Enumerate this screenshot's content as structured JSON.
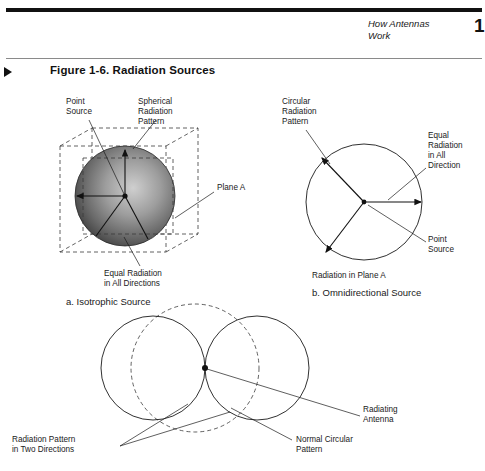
{
  "header": {
    "running_head": "How Antennas\nWork",
    "page_number": "1"
  },
  "figure": {
    "marker_icon": "right-triangle-marker-icon",
    "title": "Figure 1-6. Radiation Sources"
  },
  "panels": {
    "isotropic": {
      "caption": "a. Isotrophic Source",
      "labels": {
        "point_source": "Point\nSource",
        "spherical_pattern": "Spherical\nRadiation\nPattern",
        "plane_a": "Plane A",
        "equal_radiation": "Equal Radiation\nin All Directions"
      }
    },
    "omnidirectional": {
      "caption": "b. Omnidirectional Source",
      "labels": {
        "circular_pattern": "Circular\nRadiation\nPattern",
        "equal_radiation": "Equal\nRadiation\nin All\nDirection",
        "point_source": "Point\nSource",
        "plane_note": "Radiation in Plane A"
      }
    },
    "directional": {
      "labels": {
        "radiating_antenna": "Radiating\nAntenna",
        "normal_pattern": "Normal Circular\nPattern",
        "two_directions": "Radiation Pattern\nin Two Directions"
      }
    }
  },
  "colors": {
    "ink": "#1a1a1a",
    "rule": "#111111",
    "dash": "#3a3a3a",
    "paper": "#ffffff"
  }
}
